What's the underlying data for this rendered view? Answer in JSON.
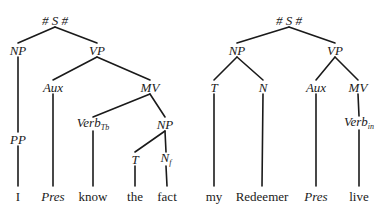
{
  "trees": [
    {
      "id": "left",
      "sentence": "I Pres know the fact",
      "nodes": [
        {
          "id": "S",
          "label": "# S #",
          "x": 55,
          "y": 20,
          "type": "category"
        },
        {
          "id": "NP1",
          "label": "NP",
          "x": 18,
          "y": 50,
          "type": "category"
        },
        {
          "id": "VP",
          "label": "VP",
          "x": 97,
          "y": 50,
          "type": "category"
        },
        {
          "id": "PP",
          "label": "PP",
          "x": 18,
          "y": 139,
          "type": "category"
        },
        {
          "id": "Aux",
          "label": "Aux",
          "x": 53,
          "y": 87,
          "type": "category"
        },
        {
          "id": "MV",
          "label": "MV",
          "x": 150,
          "y": 87,
          "type": "category"
        },
        {
          "id": "Verb",
          "label": "Verb",
          "sub": "Tb",
          "x": 93,
          "y": 124,
          "type": "category"
        },
        {
          "id": "NP2",
          "label": "NP",
          "x": 165,
          "y": 124,
          "type": "category"
        },
        {
          "id": "T",
          "label": "T",
          "x": 135,
          "y": 159,
          "type": "category"
        },
        {
          "id": "N",
          "label": "N",
          "sub": "f",
          "x": 166,
          "y": 159,
          "type": "category"
        },
        {
          "id": "w1",
          "label": "I",
          "x": 18,
          "y": 196,
          "type": "word"
        },
        {
          "id": "w2",
          "label": "Pres",
          "x": 53,
          "y": 196,
          "type": "word-italic"
        },
        {
          "id": "w3",
          "label": "know",
          "x": 93,
          "y": 196,
          "type": "word"
        },
        {
          "id": "w4",
          "label": "the",
          "x": 135,
          "y": 196,
          "type": "word"
        },
        {
          "id": "w5",
          "label": "fact",
          "x": 167,
          "y": 196,
          "type": "word"
        }
      ],
      "edges": [
        [
          "S",
          "NP1"
        ],
        [
          "S",
          "VP"
        ],
        [
          "NP1",
          "PP"
        ],
        [
          "PP",
          "w1"
        ],
        [
          "VP",
          "Aux"
        ],
        [
          "VP",
          "MV"
        ],
        [
          "Aux",
          "w2"
        ],
        [
          "MV",
          "Verb"
        ],
        [
          "MV",
          "NP2"
        ],
        [
          "Verb",
          "w3"
        ],
        [
          "NP2",
          "T"
        ],
        [
          "NP2",
          "N"
        ],
        [
          "T",
          "w4"
        ],
        [
          "N",
          "w5"
        ]
      ]
    },
    {
      "id": "right",
      "sentence": "my Redeemer Pres live",
      "nodes": [
        {
          "id": "S",
          "label": "# S #",
          "x": 289,
          "y": 20,
          "type": "category"
        },
        {
          "id": "NP",
          "label": "NP",
          "x": 237,
          "y": 50,
          "type": "category"
        },
        {
          "id": "VP",
          "label": "VP",
          "x": 335,
          "y": 50,
          "type": "category"
        },
        {
          "id": "T",
          "label": "T",
          "x": 214,
          "y": 87,
          "type": "category"
        },
        {
          "id": "N",
          "label": "N",
          "x": 263,
          "y": 87,
          "type": "category"
        },
        {
          "id": "Aux",
          "label": "Aux",
          "x": 316,
          "y": 87,
          "type": "category"
        },
        {
          "id": "MV",
          "label": "MV",
          "x": 358,
          "y": 87,
          "type": "category"
        },
        {
          "id": "Verb",
          "label": "Verb",
          "sub": "in",
          "x": 359,
          "y": 123,
          "type": "category"
        },
        {
          "id": "w1",
          "label": "my",
          "x": 214,
          "y": 196,
          "type": "word"
        },
        {
          "id": "w2",
          "label": "Redeemer",
          "x": 262,
          "y": 196,
          "type": "word"
        },
        {
          "id": "w3",
          "label": "Pres",
          "x": 316,
          "y": 196,
          "type": "word-italic"
        },
        {
          "id": "w4",
          "label": "live",
          "x": 359,
          "y": 196,
          "type": "word"
        }
      ],
      "edges": [
        [
          "S",
          "NP"
        ],
        [
          "S",
          "VP"
        ],
        [
          "NP",
          "T"
        ],
        [
          "NP",
          "N"
        ],
        [
          "T",
          "w1"
        ],
        [
          "N",
          "w2"
        ],
        [
          "VP",
          "Aux"
        ],
        [
          "VP",
          "MV"
        ],
        [
          "Aux",
          "w3"
        ],
        [
          "MV",
          "Verb"
        ],
        [
          "Verb",
          "w4"
        ]
      ]
    }
  ],
  "style": {
    "ink": "#1a1a1a",
    "background": "#ffffff"
  }
}
